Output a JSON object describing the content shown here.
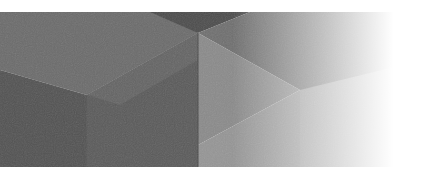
{
  "image": {
    "description": "Abstract gray isometric geometric banner fading to white on the right",
    "colors": {
      "background": "#ffffff",
      "upper_left_face": "#6b6b6b",
      "lower_left_face": "#525252",
      "top_wedge_dark": "#4c4c4c",
      "center_face": "#777777",
      "right_upper_face": "#7e7e7e",
      "right_lower_face": "#8e8e8e",
      "bottom_center_face": "#5e5e5e",
      "fade_to": "#ffffff"
    }
  }
}
